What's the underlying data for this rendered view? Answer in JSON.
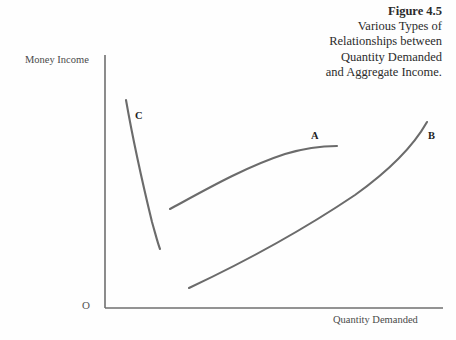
{
  "figure": {
    "title_lines": [
      "Figure 4.5",
      "Various Types of",
      "Relationships between",
      "Quantity Demanded",
      "and Aggregate Income."
    ],
    "background_color": "#fefefe",
    "axis_color": "#6f6f6f",
    "curve_color": "#6b6b6b",
    "text_color": "#2b2b2b"
  },
  "axes": {
    "y_label": "Money Income",
    "x_label": "Quantity Demanded",
    "origin_label": "O"
  },
  "curves": [
    {
      "id": "C",
      "label": "C",
      "description": "steeply downward sloping curve",
      "path": "M 126,100 C 133,140 143,185 152,222 C 156,236 158,244 160,249"
    },
    {
      "id": "A",
      "label": "A",
      "description": "concave-down rising curve flattening to the right",
      "path": "M 170,209 C 205,190 245,167 285,154 C 305,148 322,146 337,146"
    },
    {
      "id": "B",
      "label": "B",
      "description": "convex rising curve, increasing slope",
      "path": "M 189,288 C 240,264 300,232 355,195 C 390,170 414,145 427,122"
    }
  ],
  "chart_data": {
    "type": "line",
    "title": "Various Types of Relationships between Quantity Demanded and Aggregate Income.",
    "xlabel": "Quantity Demanded",
    "ylabel": "Money Income",
    "grid": false,
    "legend": "inline-curve-labels",
    "series": [
      {
        "name": "C",
        "shape": "downward-sloping",
        "points": [
          [
            0.06,
            0.83
          ],
          [
            0.1,
            0.55
          ],
          [
            0.14,
            0.34
          ],
          [
            0.16,
            0.23
          ]
        ]
      },
      {
        "name": "A",
        "shape": "concave-increasing",
        "points": [
          [
            0.19,
            0.39
          ],
          [
            0.35,
            0.5
          ],
          [
            0.53,
            0.6
          ],
          [
            0.69,
            0.64
          ]
        ]
      },
      {
        "name": "B",
        "shape": "convex-increasing",
        "points": [
          [
            0.25,
            0.08
          ],
          [
            0.44,
            0.22
          ],
          [
            0.62,
            0.41
          ],
          [
            0.8,
            0.66
          ],
          [
            0.95,
            0.82
          ]
        ]
      }
    ]
  }
}
